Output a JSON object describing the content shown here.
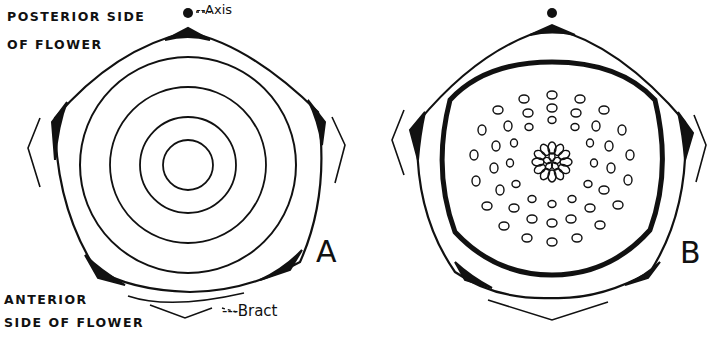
{
  "figure": {
    "labels": {
      "posterior_line1": "POSTERIOR SIDE",
      "posterior_line2": "OF FLOWER",
      "anterior_line1": "ANTERIOR",
      "anterior_line2": "SIDE OF FLOWER",
      "axis": "--Axis",
      "bract": "---Bract"
    },
    "panels": [
      {
        "id": "A",
        "label": "A"
      },
      {
        "id": "B",
        "label": "B"
      }
    ],
    "colors": {
      "ink": "#111111",
      "paper": "#ffffff"
    }
  }
}
